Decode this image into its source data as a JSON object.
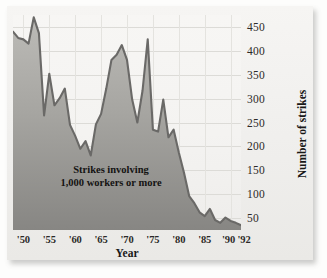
{
  "chart_data": {
    "type": "area",
    "title": "",
    "subtitle": "",
    "xlabel": "Year",
    "ylabel": "Number of strikes",
    "annotation_line1": "Strikes involving",
    "annotation_line2": "1,000 workers or more",
    "grid": true,
    "legend": "none",
    "xlim": [
      1948,
      1992
    ],
    "ylim": [
      25,
      475
    ],
    "ytick_labels": [
      "450",
      "400",
      "350",
      "300",
      "250",
      "200",
      "150",
      "100",
      "50"
    ],
    "ytick_values": [
      450,
      400,
      350,
      300,
      250,
      200,
      150,
      100,
      50
    ],
    "xtick_labels": [
      "'50",
      "'55",
      "'60",
      "'65",
      "'70",
      "'75",
      "'80",
      "'85",
      "'90",
      "'92"
    ],
    "xtick_values": [
      1950,
      1955,
      1960,
      1965,
      1970,
      1975,
      1980,
      1985,
      1990,
      1992
    ],
    "colors": {
      "line": "#6b6a68",
      "fill_top": "#b6b5b1",
      "fill_bottom": "#8e8d8a",
      "plot_background": "#f5f4f2",
      "gridline": "#dcdbd7",
      "text": "#2c2a28"
    },
    "x": [
      1948,
      1949,
      1950,
      1951,
      1952,
      1953,
      1954,
      1955,
      1956,
      1957,
      1958,
      1959,
      1960,
      1961,
      1962,
      1963,
      1964,
      1965,
      1966,
      1967,
      1968,
      1969,
      1970,
      1971,
      1972,
      1973,
      1974,
      1975,
      1976,
      1977,
      1978,
      1979,
      1980,
      1981,
      1982,
      1983,
      1984,
      1985,
      1986,
      1987,
      1988,
      1989,
      1990,
      1991,
      1992
    ],
    "values": [
      440,
      427,
      424,
      415,
      470,
      437,
      265,
      352,
      286,
      301,
      321,
      245,
      222,
      195,
      211,
      181,
      246,
      268,
      321,
      381,
      392,
      412,
      381,
      298,
      250,
      317,
      424,
      235,
      231,
      298,
      219,
      235,
      187,
      145,
      96,
      81,
      62,
      54,
      69,
      46,
      40,
      51,
      44,
      40,
      35
    ]
  }
}
